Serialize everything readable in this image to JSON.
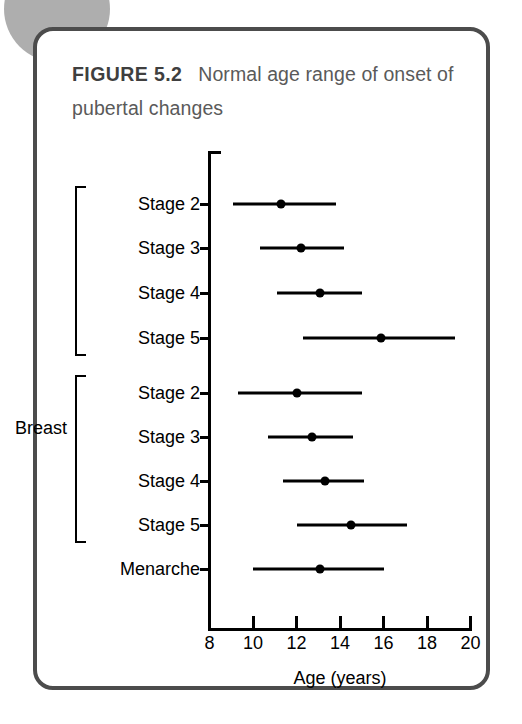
{
  "figure": {
    "label": "FIGURE 5.2",
    "caption": "Normal age range of onset of pubertal changes"
  },
  "colors": {
    "card_border": "#4c4c4c",
    "title_text": "#5a5a5a",
    "plot_ink": "#000000",
    "decoration_circle": "#aeaeae"
  },
  "chart_data": {
    "type": "bar",
    "orientation": "horizontal",
    "subtype": "range-with-median-marker",
    "title": "Normal age range of onset of pubertal changes",
    "xlabel": "Age (years)",
    "ylabel": "",
    "xlim": [
      8,
      20
    ],
    "xticks": [
      8,
      10,
      12,
      14,
      16,
      18,
      20
    ],
    "xtick_labels": [
      "8",
      "10",
      "12",
      "14",
      "16",
      "18",
      "20"
    ],
    "grid": false,
    "legend": false,
    "groups": [
      {
        "name": "Breast",
        "label_lines": [
          "Breast"
        ],
        "rows": [
          0,
          1,
          2,
          3
        ]
      },
      {
        "name": "Pubic hair",
        "label_lines": [
          "Pubic",
          "hair"
        ],
        "rows": [
          4,
          5,
          6,
          7
        ]
      }
    ],
    "categories": [
      "Stage 2",
      "Stage 3",
      "Stage 4",
      "Stage 5",
      "Stage 2",
      "Stage 3",
      "Stage 4",
      "Stage 5",
      "Menarche"
    ],
    "rows": [
      {
        "label": "Stage 2",
        "group": "Breast",
        "start": 9.1,
        "marker": 11.3,
        "end": 13.8
      },
      {
        "label": "Stage 3",
        "group": "Breast",
        "start": 10.3,
        "marker": 12.2,
        "end": 14.2
      },
      {
        "label": "Stage 4",
        "group": "Breast",
        "start": 11.1,
        "marker": 13.1,
        "end": 15.0
      },
      {
        "label": "Stage 5",
        "group": "Breast",
        "start": 12.3,
        "marker": 15.9,
        "end": 19.3
      },
      {
        "label": "Stage 2",
        "group": "Pubic hair",
        "start": 9.3,
        "marker": 12.0,
        "end": 15.0
      },
      {
        "label": "Stage 3",
        "group": "Pubic hair",
        "start": 10.7,
        "marker": 12.7,
        "end": 14.6
      },
      {
        "label": "Stage 4",
        "group": "Pubic hair",
        "start": 11.4,
        "marker": 13.3,
        "end": 15.1
      },
      {
        "label": "Stage 5",
        "group": "Pubic hair",
        "start": 12.0,
        "marker": 14.5,
        "end": 17.1
      },
      {
        "label": "Menarche",
        "group": "",
        "start": 10.0,
        "marker": 13.1,
        "end": 16.0
      }
    ]
  }
}
